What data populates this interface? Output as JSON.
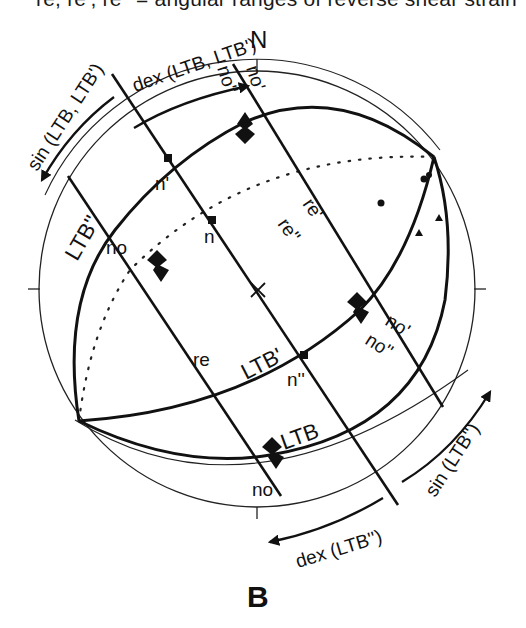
{
  "caption": "re, re', re'' = angular ranges of reverse shear strain",
  "panel_label": "B",
  "north_label": "N",
  "kinematic_arrows": {
    "top_dex": "dex (LTB, LTB')",
    "left_sin": "sin (LTB, LTB')",
    "bottom_dex": "dex (LTB'')",
    "right_sin": "sin (LTB'')"
  },
  "great_circles": {
    "ltb": "LTB",
    "ltb_prime": "LTB'",
    "ltb_double_prime": "LTB''"
  },
  "poles": {
    "n": "n",
    "n_prime": "n'",
    "n_double_prime": "n''"
  },
  "ranges": {
    "no_upper_left": "no",
    "no_bottom": "no",
    "no_prime_top": "no'",
    "no_double_prime_top": "no''",
    "no_prime_right": "no'",
    "no_double_prime_right": "no''",
    "re": "re",
    "re_prime": "re'",
    "re_double_prime": "re''"
  },
  "colors": {
    "ink": "#111111",
    "background": "#ffffff"
  }
}
